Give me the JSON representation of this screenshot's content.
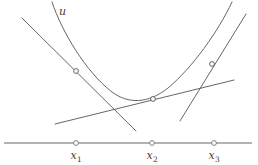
{
  "figure": {
    "type": "mathematical-diagram",
    "background_color": "#ffffff",
    "curve_color": "#555555",
    "tangent_color": "#555555",
    "axis_color": "#9a9a9a",
    "marker_fill": "#ffffff",
    "marker_stroke": "#555555",
    "text_color": "#3c3c3c"
  },
  "curve": {
    "label": "u",
    "label_x": 59,
    "label_y": 6,
    "path": "M 52,2 C 62,32 86,72 112,92 C 128,104 148,104 168,88 C 192,68 218,32 232,2",
    "stroke_width": 0.9
  },
  "axis": {
    "y": 143,
    "x_start": 4,
    "x_end": 252,
    "stroke_width": 1.6,
    "ticks": [
      {
        "name": "x1",
        "label": "x",
        "sub": "1",
        "x": 76,
        "label_y": 150
      },
      {
        "name": "x2",
        "label": "x",
        "sub": "2",
        "x": 152,
        "label_y": 150
      },
      {
        "name": "x3",
        "label": "x",
        "sub": "3",
        "x": 214,
        "label_y": 150
      }
    ],
    "tick_radius": 2.4
  },
  "tangent_points": [
    {
      "name": "point-x1",
      "x": 76,
      "y": 71,
      "radius": 2.4
    },
    {
      "name": "point-x2",
      "x": 153,
      "y": 99,
      "radius": 2.4
    },
    {
      "name": "point-x3",
      "x": 212,
      "y": 64,
      "radius": 2.4
    }
  ],
  "tangent_lines": [
    {
      "name": "tangent-at-x1",
      "x1": 22,
      "y1": 18,
      "x2": 136,
      "y2": 131,
      "stroke_width": 0.9
    },
    {
      "name": "tangent-at-x2",
      "x1": 55,
      "y1": 124,
      "x2": 234,
      "y2": 80,
      "stroke_width": 0.9
    },
    {
      "name": "tangent-at-x3",
      "x1": 180,
      "y1": 121,
      "x2": 246,
      "y2": 14,
      "stroke_width": 0.9
    }
  ]
}
